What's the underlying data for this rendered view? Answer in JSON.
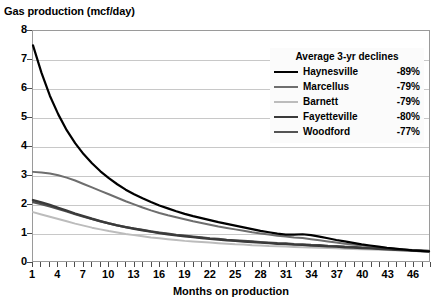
{
  "chart_data": {
    "type": "line",
    "title": "Gas production (mcf/day)",
    "xlabel": "Months on production",
    "ylabel": "Gas production (mcf/day)",
    "xlim": [
      1,
      48
    ],
    "ylim": [
      0,
      8
    ],
    "grid": true,
    "legend_position": "top-right",
    "legend_title": "Average 3-yr declines",
    "x_ticks": [
      1,
      4,
      7,
      10,
      13,
      16,
      19,
      22,
      25,
      28,
      31,
      34,
      37,
      40,
      43,
      46
    ],
    "x_tick_labels": [
      "1",
      "4",
      "7",
      "10",
      "13",
      "16",
      "19",
      "22",
      "25",
      "28",
      "31",
      "34",
      "37",
      "40",
      "43",
      "46"
    ],
    "y_ticks": [
      0,
      1,
      2,
      3,
      4,
      5,
      6,
      7,
      8
    ],
    "y_tick_labels": [
      "0",
      "1",
      "2",
      "3",
      "4",
      "5",
      "6",
      "7",
      "8"
    ],
    "x": [
      1,
      2,
      3,
      4,
      5,
      6,
      7,
      8,
      9,
      10,
      11,
      12,
      13,
      14,
      15,
      16,
      17,
      18,
      19,
      20,
      21,
      22,
      23,
      24,
      25,
      26,
      27,
      28,
      29,
      30,
      31,
      32,
      33,
      34,
      35,
      36,
      37,
      38,
      39,
      40,
      41,
      42,
      43,
      44,
      45,
      46,
      47,
      48
    ],
    "series": [
      {
        "name": "Haynesville",
        "decline": "-89%",
        "color": "#000000",
        "width": 2.2,
        "values": [
          7.5,
          6.55,
          5.75,
          5.1,
          4.55,
          4.1,
          3.72,
          3.4,
          3.12,
          2.88,
          2.67,
          2.48,
          2.32,
          2.18,
          2.05,
          1.93,
          1.83,
          1.73,
          1.64,
          1.56,
          1.49,
          1.42,
          1.35,
          1.29,
          1.23,
          1.17,
          1.11,
          1.05,
          1.0,
          0.95,
          0.92,
          0.92,
          0.93,
          0.9,
          0.85,
          0.79,
          0.73,
          0.68,
          0.63,
          0.58,
          0.54,
          0.5,
          0.46,
          0.43,
          0.4,
          0.37,
          0.35,
          0.33
        ]
      },
      {
        "name": "Marcellus",
        "decline": "-79%",
        "color": "#6e6e6e",
        "width": 2.0,
        "values": [
          3.1,
          3.08,
          3.04,
          2.98,
          2.9,
          2.8,
          2.68,
          2.56,
          2.44,
          2.32,
          2.2,
          2.08,
          1.97,
          1.86,
          1.76,
          1.67,
          1.59,
          1.52,
          1.45,
          1.38,
          1.32,
          1.26,
          1.2,
          1.15,
          1.1,
          1.05,
          1.0,
          0.96,
          0.92,
          0.88,
          0.85,
          0.82,
          0.8,
          0.76,
          0.72,
          0.68,
          0.64,
          0.6,
          0.57,
          0.54,
          0.51,
          0.48,
          0.45,
          0.42,
          0.4,
          0.37,
          0.35,
          0.33
        ]
      },
      {
        "name": "Barnett",
        "decline": "-79%",
        "color": "#bcbcbc",
        "width": 2.0,
        "values": [
          1.7,
          1.62,
          1.54,
          1.46,
          1.38,
          1.3,
          1.23,
          1.16,
          1.1,
          1.04,
          0.99,
          0.94,
          0.9,
          0.86,
          0.82,
          0.79,
          0.76,
          0.73,
          0.7,
          0.68,
          0.66,
          0.64,
          0.62,
          0.6,
          0.58,
          0.57,
          0.55,
          0.54,
          0.52,
          0.51,
          0.5,
          0.49,
          0.48,
          0.47,
          0.46,
          0.45,
          0.44,
          0.43,
          0.42,
          0.41,
          0.4,
          0.39,
          0.38,
          0.37,
          0.36,
          0.35,
          0.34,
          0.33
        ]
      },
      {
        "name": "Fayetteville",
        "decline": "-80%",
        "color": "#3a3a3a",
        "width": 2.4,
        "values": [
          2.12,
          2.04,
          1.95,
          1.85,
          1.75,
          1.65,
          1.56,
          1.47,
          1.39,
          1.31,
          1.24,
          1.18,
          1.12,
          1.07,
          1.02,
          0.97,
          0.93,
          0.89,
          0.86,
          0.83,
          0.8,
          0.77,
          0.75,
          0.72,
          0.7,
          0.68,
          0.66,
          0.64,
          0.62,
          0.6,
          0.59,
          0.57,
          0.56,
          0.54,
          0.53,
          0.51,
          0.5,
          0.48,
          0.47,
          0.45,
          0.44,
          0.42,
          0.41,
          0.39,
          0.38,
          0.36,
          0.35,
          0.34
        ]
      },
      {
        "name": "Woodford",
        "decline": "-77%",
        "color": "#545454",
        "width": 2.2,
        "values": [
          2.05,
          1.98,
          1.9,
          1.81,
          1.72,
          1.63,
          1.54,
          1.46,
          1.38,
          1.31,
          1.24,
          1.18,
          1.13,
          1.08,
          1.03,
          0.99,
          0.95,
          0.91,
          0.88,
          0.85,
          0.82,
          0.79,
          0.77,
          0.74,
          0.72,
          0.7,
          0.68,
          0.66,
          0.64,
          0.62,
          0.61,
          0.59,
          0.58,
          0.56,
          0.55,
          0.53,
          0.52,
          0.5,
          0.49,
          0.47,
          0.46,
          0.44,
          0.43,
          0.41,
          0.4,
          0.38,
          0.37,
          0.35
        ]
      }
    ]
  }
}
